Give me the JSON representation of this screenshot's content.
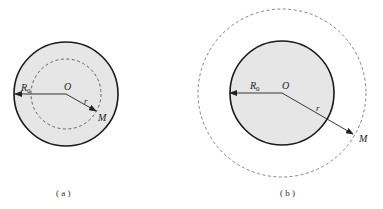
{
  "figures": [
    {
      "id": "a",
      "caption": "( a )",
      "labels": {
        "radius_sphere": "R",
        "radius_sphere_sub": "0",
        "center": "O",
        "distance": "r",
        "point": "M"
      },
      "description": "Point M inside the charged sphere (r < R0)"
    },
    {
      "id": "b",
      "caption": "( b )",
      "labels": {
        "radius_sphere": "R",
        "radius_sphere_sub": "0",
        "center": "O",
        "distance": "r",
        "point": "M"
      },
      "description": "Point M outside the charged sphere (r > R0)"
    }
  ],
  "colors": {
    "sphere_fill": "#e6e6e6",
    "sphere_stroke": "#1a1a1a",
    "dashed_stroke": "#555555",
    "arrow": "#222222"
  }
}
